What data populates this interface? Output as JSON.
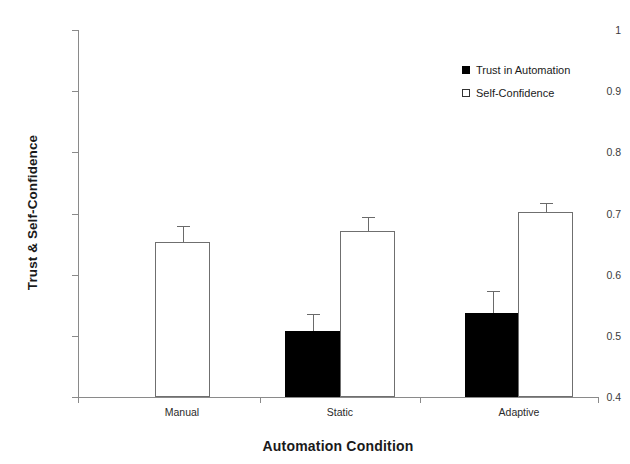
{
  "chart_data": {
    "type": "bar",
    "title": "",
    "xlabel": "Automation Condition",
    "ylabel": "Trust & Self-Confidence",
    "categories": [
      "Manual",
      "Static",
      "Adaptive"
    ],
    "ylim": [
      0.4,
      1.0
    ],
    "yticks": [
      "0.4",
      "0.5",
      "0.6",
      "0.7",
      "0.8",
      "0.9",
      "1"
    ],
    "ytick_values": [
      0.4,
      0.5,
      0.6,
      0.7,
      0.8,
      0.9,
      1.0
    ],
    "grid": false,
    "legend_position": "top-right",
    "series": [
      {
        "name": "Trust in Automation",
        "style": "filled",
        "color": "#000000",
        "values": [
          null,
          0.508,
          0.538
        ],
        "errors": [
          null,
          0.028,
          0.035
        ]
      },
      {
        "name": "Self-Confidence",
        "style": "open",
        "color": "#ffffff",
        "values": [
          0.654,
          0.672,
          0.703
        ],
        "errors": [
          0.026,
          0.022,
          0.014
        ]
      }
    ]
  },
  "legend": {
    "items": [
      {
        "label": "Trust in Automation",
        "style": "filled"
      },
      {
        "label": "Self-Confidence",
        "style": "open"
      }
    ]
  },
  "axes": {
    "y_title": "Trust & Self-Confidence",
    "x_title": "Automation Condition",
    "y_ticks": [
      "1",
      "0.9",
      "0.8",
      "0.7",
      "0.6",
      "0.5",
      "0.4"
    ],
    "x_ticks": [
      "Manual",
      "Static",
      "Adaptive"
    ]
  }
}
